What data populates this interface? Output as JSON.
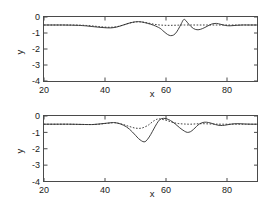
{
  "figure": {
    "title": "",
    "panels": [
      "top",
      "bottom"
    ]
  },
  "chart_data": [
    {
      "id": "top",
      "type": "line",
      "title": "",
      "xlabel": "x",
      "ylabel": "y",
      "xlim": [
        20,
        90
      ],
      "ylim": [
        -4,
        0
      ],
      "xticks": [
        20,
        40,
        60,
        80
      ],
      "xticklabels": [
        "20",
        "40",
        "60",
        "80"
      ],
      "yticks": [
        0,
        -1,
        -2,
        -3,
        -4
      ],
      "yticklabels": [
        "0",
        "-1",
        "-2",
        "-3",
        "-4"
      ],
      "grid": false,
      "legend": "none",
      "baseline": -0.5,
      "series": [
        {
          "name": "dotted",
          "style": "dotted",
          "x": [
            20,
            23,
            26,
            29,
            32,
            34,
            36,
            38,
            40,
            42,
            44,
            46,
            48,
            50,
            52,
            54,
            56,
            58,
            60,
            62,
            64,
            65,
            66,
            68,
            70,
            72,
            74,
            76,
            78,
            80,
            83,
            86,
            90
          ],
          "y": [
            -0.5,
            -0.5,
            -0.5,
            -0.5,
            -0.51,
            -0.53,
            -0.56,
            -0.6,
            -0.63,
            -0.64,
            -0.6,
            -0.5,
            -0.38,
            -0.31,
            -0.31,
            -0.37,
            -0.45,
            -0.5,
            -0.52,
            -0.52,
            -0.51,
            -0.5,
            -0.5,
            -0.5,
            -0.5,
            -0.5,
            -0.5,
            -0.5,
            -0.5,
            -0.5,
            -0.5,
            -0.5,
            -0.5
          ]
        },
        {
          "name": "solid",
          "style": "solid",
          "x": [
            20,
            23,
            26,
            29,
            32,
            34,
            36,
            38,
            40,
            42,
            44,
            46,
            48,
            50,
            51,
            52,
            54,
            56,
            58,
            59,
            60,
            61,
            62,
            63,
            64,
            65,
            65.8,
            66.5,
            67.5,
            69,
            70.5,
            72,
            73.5,
            75,
            76.5,
            78,
            79.5,
            81,
            83,
            85,
            87,
            90
          ],
          "y": [
            -0.5,
            -0.5,
            -0.5,
            -0.51,
            -0.53,
            -0.56,
            -0.6,
            -0.64,
            -0.67,
            -0.68,
            -0.62,
            -0.5,
            -0.38,
            -0.3,
            -0.29,
            -0.31,
            -0.4,
            -0.52,
            -0.7,
            -0.86,
            -1.02,
            -1.14,
            -1.16,
            -1.05,
            -0.78,
            -0.42,
            -0.16,
            -0.22,
            -0.46,
            -0.72,
            -0.8,
            -0.72,
            -0.58,
            -0.44,
            -0.4,
            -0.46,
            -0.53,
            -0.55,
            -0.52,
            -0.5,
            -0.5,
            -0.5
          ]
        }
      ]
    },
    {
      "id": "bottom",
      "type": "line",
      "title": "",
      "xlabel": "x",
      "ylabel": "y",
      "xlim": [
        20,
        90
      ],
      "ylim": [
        -4,
        0
      ],
      "xticks": [
        20,
        40,
        60,
        80
      ],
      "xticklabels": [
        "20",
        "40",
        "60",
        "80"
      ],
      "yticks": [
        0,
        -1,
        -2,
        -3,
        -4
      ],
      "yticklabels": [
        "0",
        "-1",
        "-2",
        "-3",
        "-4"
      ],
      "grid": false,
      "legend": "none",
      "baseline": -0.5,
      "series": [
        {
          "name": "dotted",
          "style": "dotted",
          "x": [
            20,
            24,
            28,
            31,
            34,
            36,
            38,
            40,
            42,
            43,
            44,
            46,
            48,
            50,
            52,
            54,
            55,
            56,
            57,
            58,
            60,
            62,
            64,
            66,
            68,
            70,
            72,
            75,
            78,
            82,
            86,
            90
          ],
          "y": [
            -0.5,
            -0.5,
            -0.5,
            -0.51,
            -0.52,
            -0.52,
            -0.5,
            -0.46,
            -0.42,
            -0.41,
            -0.43,
            -0.52,
            -0.64,
            -0.74,
            -0.74,
            -0.58,
            -0.44,
            -0.3,
            -0.2,
            -0.18,
            -0.26,
            -0.38,
            -0.46,
            -0.49,
            -0.5,
            -0.48,
            -0.47,
            -0.49,
            -0.5,
            -0.5,
            -0.5,
            -0.5
          ]
        },
        {
          "name": "solid",
          "style": "solid",
          "x": [
            20,
            24,
            28,
            31,
            34,
            36,
            38,
            40,
            42,
            43,
            44,
            45,
            46,
            47,
            48,
            49,
            50,
            51,
            52,
            52.8,
            53.5,
            54.5,
            55.5,
            56.5,
            57.5,
            58.5,
            60,
            61.5,
            63,
            64.5,
            66,
            67,
            68,
            69,
            70,
            71,
            72.5,
            74,
            75.5,
            77,
            78.5,
            80,
            82,
            84,
            86,
            88,
            90
          ],
          "y": [
            -0.5,
            -0.5,
            -0.5,
            -0.51,
            -0.52,
            -0.52,
            -0.49,
            -0.45,
            -0.41,
            -0.4,
            -0.43,
            -0.48,
            -0.56,
            -0.66,
            -0.8,
            -0.98,
            -1.18,
            -1.38,
            -1.52,
            -1.58,
            -1.52,
            -1.28,
            -0.96,
            -0.62,
            -0.32,
            -0.16,
            -0.16,
            -0.28,
            -0.48,
            -0.72,
            -0.92,
            -1.0,
            -0.96,
            -0.82,
            -0.64,
            -0.48,
            -0.38,
            -0.4,
            -0.48,
            -0.56,
            -0.58,
            -0.54,
            -0.48,
            -0.47,
            -0.49,
            -0.5,
            -0.5
          ]
        }
      ]
    }
  ]
}
